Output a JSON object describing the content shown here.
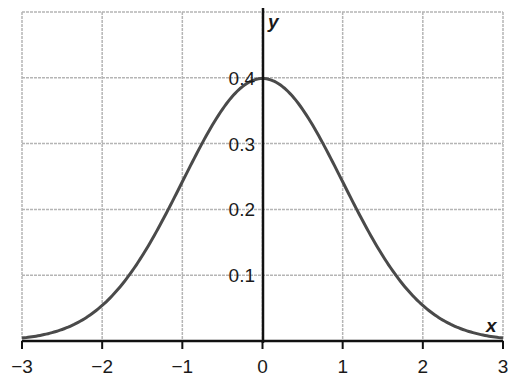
{
  "chart_data": {
    "type": "line",
    "title": "",
    "xlabel": "x",
    "ylabel": "y",
    "xlim": [
      -3,
      3
    ],
    "ylim": [
      0,
      0.5
    ],
    "grid": true,
    "legend": null,
    "x_ticks": [
      "−3",
      "−2",
      "−1",
      "0",
      "1",
      "2",
      "3"
    ],
    "y_ticks": [
      "0.1",
      "0.2",
      "0.3",
      "0.4"
    ],
    "series": [
      {
        "name": "standard normal density",
        "x": [
          -3,
          -2.5,
          -2,
          -1.5,
          -1,
          -0.5,
          0,
          0.5,
          1,
          1.5,
          2,
          2.5,
          3
        ],
        "values": [
          0.004,
          0.018,
          0.054,
          0.13,
          0.242,
          0.352,
          0.399,
          0.352,
          0.242,
          0.13,
          0.054,
          0.018,
          0.004
        ]
      }
    ]
  },
  "colors": {
    "curve": "#4a4a4a",
    "axis": "#111111",
    "grid": "#b5b5b5"
  }
}
